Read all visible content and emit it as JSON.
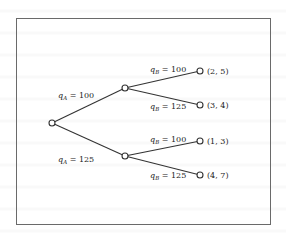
{
  "diagram": {
    "type": "game-tree",
    "root": {
      "id": "root",
      "x": 52,
      "y": 123
    },
    "nodes": [
      {
        "id": "a100",
        "x": 125,
        "y": 88
      },
      {
        "id": "a125",
        "x": 125,
        "y": 156
      }
    ],
    "edges_A": [
      {
        "from": "root",
        "to": "a100",
        "label_var": "q",
        "label_sub": "A",
        "label_val": "= 100",
        "lx": 55,
        "ly": 98
      },
      {
        "from": "root",
        "to": "a125",
        "label_var": "q",
        "label_sub": "A",
        "label_val": "= 125",
        "lx": 55,
        "ly": 158
      }
    ],
    "leaves": [
      {
        "parent": "a100",
        "x": 200,
        "y": 71,
        "payoff": "(2, 5)",
        "label_var": "q",
        "label_sub": "B",
        "label_val": "= 100",
        "lx": 152,
        "ly": 64
      },
      {
        "parent": "a100",
        "x": 200,
        "y": 105,
        "payoff": "(3, 4)",
        "label_var": "q",
        "label_sub": "B",
        "label_val": "= 125",
        "lx": 152,
        "ly": 108
      },
      {
        "parent": "a125",
        "x": 200,
        "y": 141,
        "payoff": "(1, 3)",
        "label_var": "q",
        "label_sub": "B",
        "label_val": "= 100",
        "lx": 152,
        "ly": 140
      },
      {
        "parent": "a125",
        "x": 200,
        "y": 175,
        "payoff": "(4, 7)",
        "label_var": "q",
        "label_sub": "B",
        "label_val": "= 125",
        "lx": 152,
        "ly": 178
      }
    ]
  },
  "labels": {
    "qA100": "q",
    "qA100_sub": "A",
    "qA100_val": " = 100",
    "qA125": "q",
    "qA125_sub": "A",
    "qA125_val": " = 125",
    "qB100a": "q",
    "qB100a_sub": "B",
    "qB100a_val": " = 100",
    "qB125a": "q",
    "qB125a_sub": "B",
    "qB125a_val": " = 125",
    "qB100b": "q",
    "qB100b_sub": "B",
    "qB100b_val": " = 100",
    "qB125b": "q",
    "qB125b_sub": "B",
    "qB125b_val": " = 125",
    "payoff1": "(2, 5)",
    "payoff2": "(3, 4)",
    "payoff3": "(1, 3)",
    "payoff4": "(4, 7)"
  },
  "colors": {
    "line": "#333333",
    "frame": "#6a6a6a",
    "text": "#222222"
  }
}
